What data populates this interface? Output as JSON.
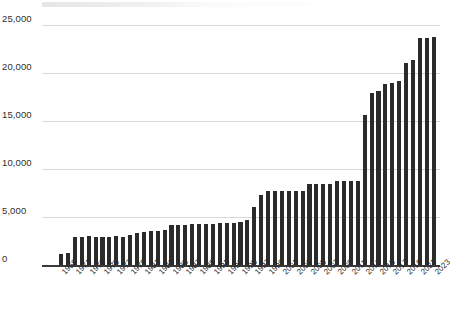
{
  "chart_data": {
    "type": "bar",
    "title": "",
    "subtitle": "",
    "xlabel": "",
    "ylabel": "",
    "ylim": [
      0,
      26000
    ],
    "yticks": [
      0,
      5000,
      10000,
      15000,
      20000,
      25000
    ],
    "ytick_labels": [
      "0",
      "5,000",
      "10,000",
      "15,000",
      "20,000",
      "25,000"
    ],
    "grid": true,
    "legend": "none",
    "bar_color": "#2b2b2b",
    "gridline_color": "#d8d8d8",
    "axis_color": "#3a3a3a",
    "label_color": "#2b2b2b",
    "background_color": "#ffffff",
    "xtick_label_rotation": -45,
    "xtick_label_interval": 2,
    "categories": [
      "1969",
      "1970",
      "1971",
      "1972",
      "1973",
      "1974",
      "1975",
      "1976",
      "1977",
      "1978",
      "1979",
      "1980",
      "1981",
      "1982",
      "1983",
      "1984",
      "1985",
      "1986",
      "1987",
      "1988",
      "1989",
      "1990",
      "1991",
      "1992",
      "1993",
      "1994",
      "1995",
      "1996",
      "1997",
      "1998",
      "1999",
      "2000",
      "2001",
      "2002",
      "2003",
      "2004",
      "2005",
      "2006",
      "2007",
      "2008",
      "2009",
      "2010",
      "2011",
      "2012",
      "2013",
      "2014",
      "2015",
      "2016",
      "2017",
      "2018",
      "2019",
      "2020",
      "2021",
      "2022",
      "2023"
    ],
    "xtick_labels": [
      "1969",
      "1971",
      "1973",
      "1975",
      "1977",
      "1979",
      "1981",
      "1983",
      "1985",
      "1987",
      "1989",
      "1991",
      "1993",
      "1995",
      "1997",
      "1999",
      "2001",
      "2003",
      "2005",
      "2007",
      "2009",
      "2011",
      "2013",
      "2015",
      "2017",
      "2019",
      "2021",
      "2023"
    ],
    "values": [
      1150,
      1200,
      2900,
      2950,
      3000,
      2950,
      2900,
      2950,
      3000,
      2950,
      3100,
      3350,
      3450,
      3500,
      3550,
      3600,
      4150,
      4200,
      4200,
      4250,
      4250,
      4300,
      4300,
      4350,
      4400,
      4400,
      4500,
      4650,
      6050,
      7250,
      7700,
      7750,
      7700,
      7750,
      7700,
      7750,
      8400,
      8450,
      8450,
      8450,
      8800,
      8800,
      8800,
      8800,
      15600,
      17950,
      18100,
      18850,
      19000,
      19200,
      21000,
      21350,
      23600,
      23650,
      23700
    ]
  }
}
